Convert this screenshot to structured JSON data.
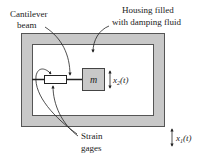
{
  "diagram": {
    "type": "accelerometer-schematic",
    "labels": {
      "cantilever_line1": "Cantilever",
      "cantilever_line2": "beam",
      "housing_line1": "Housing filled",
      "housing_line2": "with damping fluid",
      "mass": "m",
      "x2_base": "x",
      "x2_sub": "2",
      "x2_arg": "(t)",
      "x1_base": "x",
      "x1_sub": "1",
      "x1_arg": "(t)",
      "strain_line1": "Strain",
      "strain_line2": "gages"
    },
    "colors": {
      "housing_fill": "#c8c8c8",
      "housing_stroke": "#555555",
      "mass_fill": "#c8c8c8",
      "line": "#222222",
      "background": "#ffffff"
    }
  }
}
